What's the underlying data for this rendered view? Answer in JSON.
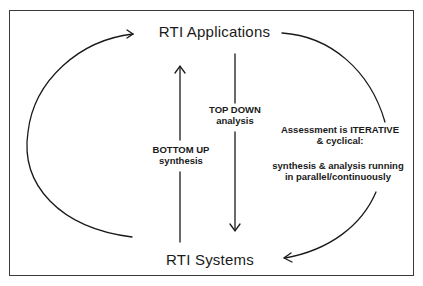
{
  "diagram": {
    "nodes": {
      "top": "RTI  Applications",
      "bottom": "RTI  Systems"
    },
    "edges": {
      "top_down": {
        "line1": "TOP DOWN",
        "line2": "analysis"
      },
      "bottom_up": {
        "line1": "BOTTOM UP",
        "line2": "synthesis"
      }
    },
    "note": {
      "line1": "Assessment is ITERATIVE",
      "line2": "& cyclical:",
      "line3": "synthesis & analysis running",
      "line4": "in parallel/continuously"
    },
    "colors": {
      "stroke": "#1a1a1a",
      "frame": "#3a3a3a",
      "background": "#ffffff"
    }
  }
}
